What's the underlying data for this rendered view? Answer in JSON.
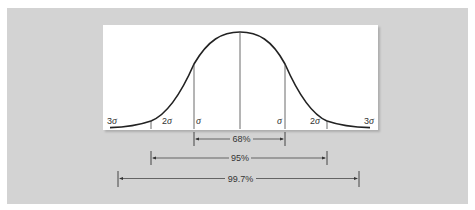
{
  "figure": {
    "colors": {
      "background": "#d3d3d3",
      "panel": "#ffffff",
      "curve": "#222222",
      "lines": "#444444"
    },
    "sigma_labels": {
      "left_3": "3σ",
      "left_2": "2σ",
      "left_1": "σ",
      "right_1": "σ",
      "right_2": "2σ",
      "right_3": "3σ"
    },
    "ranges": [
      {
        "label": "68%",
        "from": "-1σ",
        "to": "+1σ"
      },
      {
        "label": "95%",
        "from": "-2σ",
        "to": "+2σ"
      },
      {
        "label": "99.7%",
        "from": "-3σ",
        "to": "+3σ"
      }
    ]
  },
  "chart_data": {
    "type": "line",
    "title": "",
    "xlabel": "",
    "ylabel": "",
    "x_ticks": [
      "3σ",
      "2σ",
      "σ",
      "mean",
      "σ",
      "2σ",
      "3σ"
    ],
    "x": [
      -3,
      -2,
      -1,
      0,
      1,
      2,
      3
    ],
    "values": [
      0.0044,
      0.054,
      0.242,
      0.399,
      0.242,
      0.054,
      0.0044
    ],
    "annotations": [
      {
        "text": "68%",
        "range": [
          -1,
          1
        ]
      },
      {
        "text": "95%",
        "range": [
          -2,
          2
        ]
      },
      {
        "text": "99.7%",
        "range": [
          -3,
          3
        ]
      }
    ]
  }
}
